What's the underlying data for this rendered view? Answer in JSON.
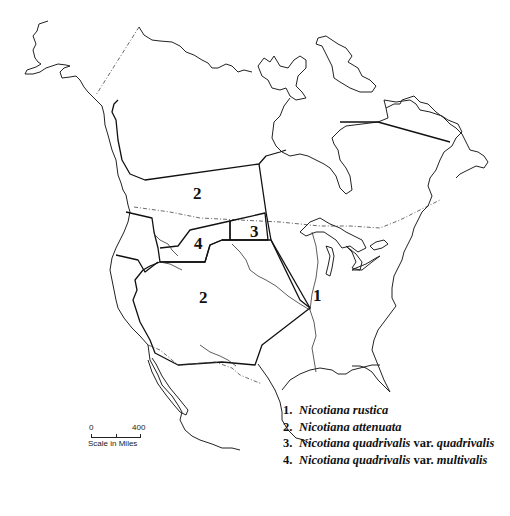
{
  "map": {
    "title": "Distribution of Nicotiana species in North America",
    "regions": [
      {
        "label": "1",
        "x": 311,
        "y": 297
      },
      {
        "label": "2",
        "x": 192,
        "y": 183
      },
      {
        "label": "2",
        "x": 199,
        "y": 287
      },
      {
        "label": "3",
        "x": 250,
        "y": 224
      },
      {
        "label": "4",
        "x": 194,
        "y": 236
      }
    ],
    "legend": [
      {
        "num": "1.",
        "name": "Nicotiana rustica",
        "suffix": ""
      },
      {
        "num": "2.",
        "name": "Nicotiana attenuata",
        "suffix": ""
      },
      {
        "num": "3.",
        "name": "Nicotiana quadrivalis",
        "suffix": " var. ",
        "variety": "quadrivalis"
      },
      {
        "num": "4.",
        "name": "Nicotiana quadrivalis",
        "suffix": " var. ",
        "variety": "multivalis"
      }
    ],
    "scale": {
      "min": "0",
      "max": "400",
      "caption": "Scale in Miles"
    }
  }
}
